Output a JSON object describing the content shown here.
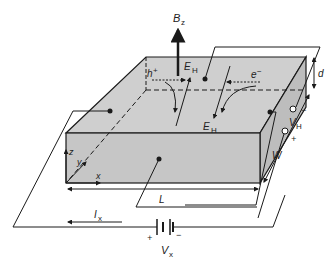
{
  "labels": {
    "bfield": "B",
    "bfield_sub": "z",
    "hole": "h",
    "hole_sup": "+",
    "electron": "e",
    "electron_sup": "−",
    "eh_top": "E",
    "eh_top_sub": "H",
    "eh_bottom": "E",
    "eh_bottom_sub": "H",
    "thickness": "d",
    "width": "W",
    "length": "L",
    "axis_z": "z",
    "axis_y": "y",
    "axis_x": "x",
    "vh": "V",
    "vh_sub": "H",
    "vh_minus": "−",
    "vh_plus": "+",
    "current": "I",
    "current_sub": "x",
    "vx": "V",
    "vx_sub": "x",
    "battery_plus": "+",
    "battery_minus": "−"
  },
  "colors": {
    "slab_fill": "#c8c8c8",
    "slab_top": "#cfcfcf",
    "line": "#1a1a1a"
  }
}
